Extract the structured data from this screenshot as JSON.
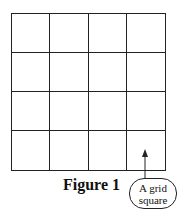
{
  "figure": {
    "caption": "Figure 1",
    "grid": {
      "rows": 4,
      "columns": 4
    },
    "callout": {
      "line1": "A grid",
      "line2": "square"
    }
  }
}
